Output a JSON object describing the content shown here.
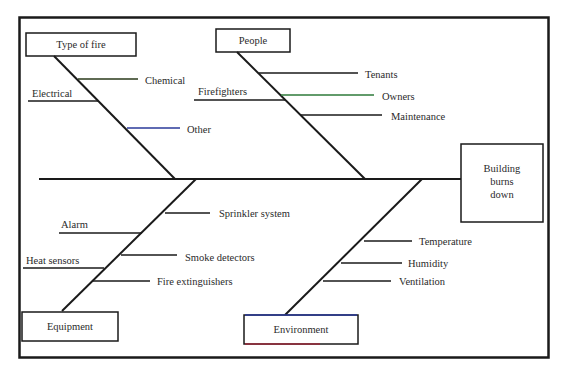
{
  "diagram": {
    "type": "fishbone",
    "effect": {
      "lines": [
        "Building",
        "burns",
        "down"
      ]
    },
    "categories": [
      {
        "id": "type-of-fire",
        "label": "Type of fire",
        "causes": [
          "Chemical",
          "Electrical",
          "Other"
        ]
      },
      {
        "id": "people",
        "label": "People",
        "causes": [
          "Tenants",
          "Firefighters",
          "Owners",
          "Maintenance"
        ]
      },
      {
        "id": "equipment",
        "label": "Equipment",
        "causes": [
          "Sprinkler system",
          "Alarm",
          "Smoke detectors",
          "Heat sensors",
          "Fire extinguishers"
        ]
      },
      {
        "id": "environment",
        "label": "Environment",
        "causes": [
          "Temperature",
          "Humidity",
          "Ventilation"
        ]
      }
    ]
  },
  "colors": {
    "line": "#1a1a1a",
    "other_bone": "#2a3a9a",
    "owners_bone": "#2e7a3a",
    "environment_top": "#2a3a9a",
    "environment_bottom": "#9a2a3a"
  }
}
